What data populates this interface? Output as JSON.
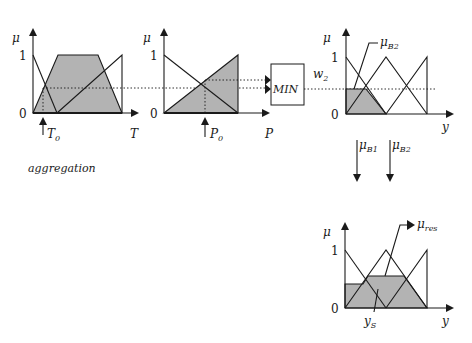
{
  "diagram": {
    "colors": {
      "shade": "#b3b3b3",
      "line": "#1a1a1a",
      "background": "#ffffff"
    },
    "panel_T": {
      "y_axis_label": "μ",
      "tick_one": "1",
      "tick_zero": "0",
      "x_axis_label": "T",
      "input_label_main": "T",
      "input_label_sub": "0"
    },
    "panel_P": {
      "y_axis_label": "μ",
      "tick_one": "1",
      "tick_zero": "0",
      "x_axis_label": "P",
      "input_label_main": "P",
      "input_label_sub": "0"
    },
    "min_operator": {
      "label": "MIN"
    },
    "weight": {
      "main": "w",
      "sub": "2"
    },
    "panel_output": {
      "y_axis_label": "μ",
      "tick_one": "1",
      "tick_zero": "0",
      "x_axis_label": "y",
      "callout_main": "μ",
      "callout_sub": "B2"
    },
    "arrows": [
      {
        "main": "μ",
        "sub": "B1"
      },
      {
        "main": "μ",
        "sub": "B2"
      }
    ],
    "aggregation_label": "aggregation",
    "panel_result": {
      "y_axis_label": "μ",
      "tick_one": "1",
      "tick_zero": "0",
      "x_axis_label": "y",
      "callout_main": "μ",
      "callout_sub": "res",
      "defuzz_main": "y",
      "defuzz_sub": "S"
    }
  }
}
